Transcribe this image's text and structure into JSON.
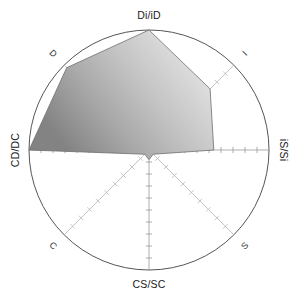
{
  "chart_data": {
    "type": "radar",
    "title": "",
    "subtitle": "",
    "xlabel": "",
    "ylabel": "",
    "grid": true,
    "legend_position": "none",
    "axis_max": 100,
    "axis_min": 0,
    "ticks_per_axis": 10,
    "categories": [
      "Di/iD",
      "I",
      "iS/Si",
      "S",
      "CS/SC",
      "C",
      "CD/DC",
      "D"
    ],
    "angles_deg": [
      90,
      45,
      0,
      -45,
      -90,
      -135,
      180,
      135
    ],
    "series": [
      {
        "name": "profile",
        "values": [
          100,
          72,
          54,
          5,
          8,
          5,
          100,
          97
        ]
      }
    ],
    "annotations": []
  },
  "axes": [
    {
      "id": "axis-di-id",
      "label": "Di/iD",
      "position": "top",
      "rotation": 0,
      "value": 100,
      "style": "major"
    },
    {
      "id": "axis-i",
      "label": "I",
      "position": "top-right",
      "rotation": -45,
      "value": 72,
      "style": "minor"
    },
    {
      "id": "axis-is-si",
      "label": "iS/Si",
      "position": "right",
      "rotation": 90,
      "value": 54,
      "style": "major"
    },
    {
      "id": "axis-s",
      "label": "S",
      "position": "bottom-right",
      "rotation": -45,
      "value": 5,
      "style": "minor"
    },
    {
      "id": "axis-cs-sc",
      "label": "CS/SC",
      "position": "bottom",
      "rotation": 0,
      "value": 8,
      "style": "major"
    },
    {
      "id": "axis-c",
      "label": "C",
      "position": "bottom-left",
      "rotation": 45,
      "value": 5,
      "style": "minor"
    },
    {
      "id": "axis-cd-dc",
      "label": "CD/DC",
      "position": "left",
      "rotation": -90,
      "value": 100,
      "style": "major"
    },
    {
      "id": "axis-d",
      "label": "D",
      "position": "top-left",
      "rotation": 45,
      "value": 97,
      "style": "minor"
    }
  ],
  "colors": {
    "outer_circle": "#555555",
    "axis_major": "#9a9a9a",
    "axis_minor": "#b5b5b5",
    "series_stroke": "#6e6e6e",
    "series_fill_light": "#e9e9e9",
    "series_fill_mid": "#b6b6b6",
    "series_fill_dark": "#7d7d7d",
    "label_text": "#1a1a1a",
    "background": "#ffffff"
  },
  "geometry": {
    "center_x": 149,
    "center_y": 150,
    "radius": 120
  }
}
